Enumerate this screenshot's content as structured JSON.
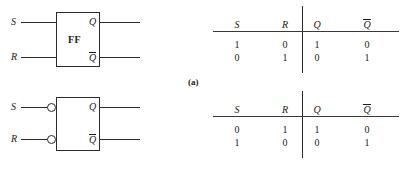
{
  "figure": {
    "panel_label": "(a)",
    "diagrams": [
      {
        "id": "sr-flip-flop-active-high",
        "block_label": "FF",
        "inputs": [
          {
            "name": "S",
            "label": "S",
            "inverted": false
          },
          {
            "name": "R",
            "label": "R",
            "inverted": false
          }
        ],
        "outputs": [
          {
            "name": "Q",
            "label": "Q",
            "overline": false
          },
          {
            "name": "Qbar",
            "label": "Q",
            "overline": true
          }
        ]
      },
      {
        "id": "sr-flip-flop-active-low",
        "block_label": "",
        "inputs": [
          {
            "name": "S",
            "label": "S",
            "inverted": true
          },
          {
            "name": "R",
            "label": "R",
            "inverted": true
          }
        ],
        "outputs": [
          {
            "name": "Q",
            "label": "Q",
            "overline": false
          },
          {
            "name": "Qbar",
            "label": "Q",
            "overline": true
          }
        ]
      }
    ],
    "tables": [
      {
        "id": "truth-table-active-high",
        "headers": [
          {
            "label": "S",
            "overline": false
          },
          {
            "label": "R",
            "overline": false
          },
          {
            "label": "Q",
            "overline": false
          },
          {
            "label": "Q",
            "overline": true
          }
        ],
        "rows": [
          [
            "1",
            "0",
            "1",
            "0"
          ],
          [
            "0",
            "1",
            "0",
            "1"
          ]
        ]
      },
      {
        "id": "truth-table-active-low",
        "headers": [
          {
            "label": "S",
            "overline": false
          },
          {
            "label": "R",
            "overline": false
          },
          {
            "label": "Q",
            "overline": false
          },
          {
            "label": "Q",
            "overline": true
          }
        ],
        "rows": [
          [
            "0",
            "1",
            "1",
            "0"
          ],
          [
            "1",
            "0",
            "0",
            "1"
          ]
        ]
      }
    ]
  },
  "colors": {
    "background": "#ffffff",
    "ink": "#1a1a1a",
    "line": "#2b2b2b",
    "rule": "#3a3a3a"
  }
}
